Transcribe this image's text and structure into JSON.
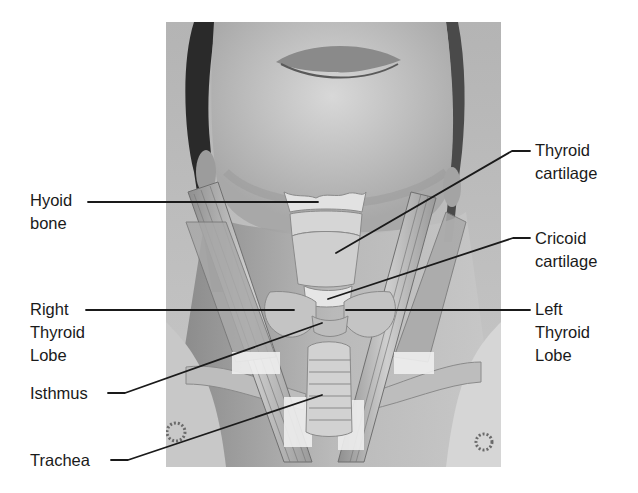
{
  "figure": {
    "photo": {
      "description": "Grayscale photo of a person's chin and neck with head tilted back, overlaid with illustrated larynx, thyroid gland, trachea, sternocleidomastoid muscles and clavicles",
      "background_gray": "#a9a9a9"
    },
    "labels": {
      "hyoid_bone": {
        "line1": "Hyoid",
        "line2": "bone"
      },
      "right_thyroid_lobe": {
        "line1": "Right",
        "line2": "Thyroid",
        "line3": "Lobe"
      },
      "isthmus": {
        "line1": "Isthmus"
      },
      "trachea": {
        "line1": "Trachea"
      },
      "thyroid_cartilage": {
        "line1": "Thyroid",
        "line2": "cartilage"
      },
      "cricoid_cartilage": {
        "line1": "Cricoid",
        "line2": "cartilage"
      },
      "left_thyroid_lobe": {
        "line1": "Left",
        "line2": "Thyroid",
        "line3": "Lobe"
      }
    },
    "leader_color": "#1a1a1a"
  }
}
